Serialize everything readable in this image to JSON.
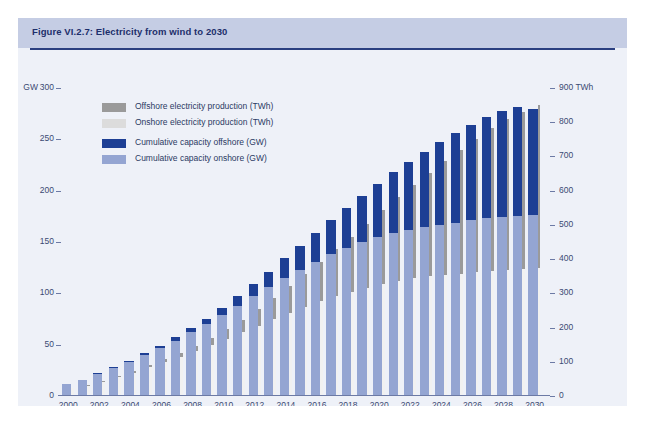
{
  "figure": {
    "title": "Figure VI.2.7: Electricity from wind to 2030",
    "source": "Source: EWEA (2008a)"
  },
  "legend": [
    {
      "label": "Offshore electricity production (TWh)",
      "color": "#9a9a9a",
      "key": "prod_offshore"
    },
    {
      "label": "Onshore electricity production (TWh)",
      "color": "#dcdcdc",
      "key": "prod_onshore"
    },
    {
      "label": "Cumulative capacity offshore (GW)",
      "color": "#1d3f94",
      "key": "cap_offshore"
    },
    {
      "label": "Cumulative capacity onshore (GW)",
      "color": "#94a5d2",
      "key": "cap_onshore"
    }
  ],
  "axes": {
    "left_unit": "GW",
    "left_ticks": [
      "300",
      "250",
      "200",
      "150",
      "100",
      "50",
      "0"
    ],
    "left_values": [
      300,
      250,
      200,
      150,
      100,
      50,
      0
    ],
    "right_unit": "TWh",
    "right_ticks": [
      "900",
      "800",
      "700",
      "600",
      "500",
      "400",
      "300",
      "200",
      "100",
      "0"
    ],
    "right_values": [
      900,
      800,
      700,
      600,
      500,
      400,
      300,
      200,
      100,
      0
    ],
    "right_top_label": "900 TWh",
    "x_ticks": [
      "2000",
      "2002",
      "2004",
      "2006",
      "2008",
      "2010",
      "2012",
      "2014",
      "2016",
      "2018",
      "2020",
      "2022",
      "2024",
      "2026",
      "2028",
      "2030"
    ]
  },
  "chart_data": {
    "type": "bar",
    "title": "Figure VI.2.7: Electricity from wind to 2030",
    "xlabel": "",
    "ylabel": "GW",
    "y2label": "TWh",
    "ylim": [
      0,
      300
    ],
    "y2lim": [
      0,
      900
    ],
    "grid": false,
    "legend_position": "inside-top-left",
    "stacked": true,
    "categories": [
      2000,
      2001,
      2002,
      2003,
      2004,
      2005,
      2006,
      2007,
      2008,
      2009,
      2010,
      2011,
      2012,
      2013,
      2014,
      2015,
      2016,
      2017,
      2018,
      2019,
      2020,
      2021,
      2022,
      2023,
      2024,
      2025,
      2026,
      2027,
      2028,
      2029,
      2030
    ],
    "series": [
      {
        "name": "Cumulative capacity onshore (GW)",
        "unit": "GW",
        "axis": "left",
        "color": "#94a5d2",
        "values": [
          12,
          16,
          21,
          27,
          33,
          40,
          47,
          54,
          62,
          70,
          79,
          88,
          97,
          106,
          115,
          123,
          131,
          138,
          144,
          150,
          155,
          159,
          162,
          165,
          167,
          169,
          171,
          173,
          174,
          175,
          176
        ]
      },
      {
        "name": "Cumulative capacity offshore (GW)",
        "unit": "GW",
        "axis": "left",
        "color": "#1d3f94",
        "values": [
          0,
          0,
          1,
          1,
          1,
          2,
          2,
          3,
          4,
          5,
          7,
          9,
          12,
          15,
          19,
          23,
          28,
          33,
          39,
          45,
          52,
          59,
          66,
          73,
          80,
          87,
          93,
          99,
          104,
          107,
          104
        ]
      },
      {
        "name": "Onshore electricity production (TWh)",
        "unit": "TWh",
        "axis": "right",
        "color": "#f1f1f1",
        "values": [
          24,
          32,
          43,
          55,
          68,
          84,
          99,
          114,
          131,
          148,
          167,
          186,
          205,
          224,
          243,
          261,
          278,
          292,
          305,
          317,
          328,
          337,
          344,
          350,
          354,
          358,
          362,
          366,
          369,
          371,
          373
        ]
      },
      {
        "name": "Offshore electricity production (TWh)",
        "unit": "TWh",
        "axis": "right",
        "color": "#9a9a9a",
        "values": [
          0,
          1,
          2,
          3,
          5,
          7,
          9,
          12,
          16,
          21,
          28,
          37,
          49,
          62,
          78,
          95,
          115,
          137,
          161,
          187,
          215,
          244,
          273,
          303,
          333,
          362,
          390,
          416,
          440,
          460,
          476
        ]
      }
    ]
  },
  "colors": {
    "panel_bg": "#eef1f8",
    "header_band": "#c5cde4",
    "header_rule": "#2b3f80",
    "title_text": "#1d2f6b",
    "axis_text": "#3b4a73",
    "axis_line": "#6c7aa5"
  }
}
